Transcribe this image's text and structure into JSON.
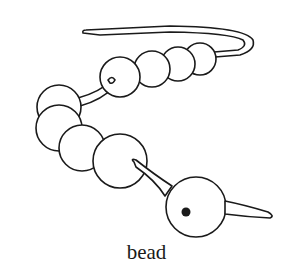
{
  "illustration": {
    "subject": "beads on a string",
    "caption": "bead",
    "colors": {
      "line": "#1a1a1a",
      "fill": "#ffffff",
      "background": "#ffffff"
    }
  }
}
